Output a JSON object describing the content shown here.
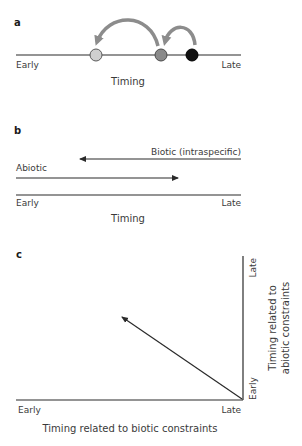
{
  "panels": {
    "a": {
      "label": "a",
      "axis_start": "Early",
      "axis_end": "Late",
      "axis_title": "Timing",
      "points": [
        {
          "name": "early-shifted",
          "x": 96,
          "color": "#cfcfcf"
        },
        {
          "name": "intermediate",
          "x": 161,
          "color": "#8a8a8a"
        },
        {
          "name": "original",
          "x": 192,
          "color": "#111111"
        }
      ],
      "arrow_color": "#8c8c8c"
    },
    "b": {
      "label": "b",
      "biotic_label": "Biotic (intraspecific)",
      "abiotic_label": "Abiotic",
      "axis_start": "Early",
      "axis_end": "Late",
      "axis_title": "Timing"
    },
    "c": {
      "label": "c",
      "x_start": "Early",
      "x_end": "Late",
      "x_title": "Timing related to biotic constraints",
      "y_start": "Early",
      "y_end": "Late",
      "y_title_line1": "Timing related to",
      "y_title_line2": "abiotic constraints"
    }
  },
  "colors": {
    "line": "#2a2a2a",
    "text": "#3a3a3a",
    "arrow_gray": "#8c8c8c"
  }
}
